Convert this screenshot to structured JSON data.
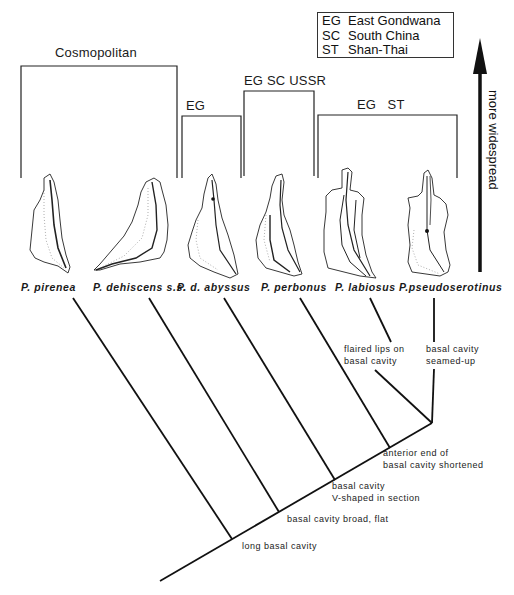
{
  "legend": {
    "items": [
      {
        "code": "EG",
        "name": "East Gondwana"
      },
      {
        "code": "SC",
        "name": "South China"
      },
      {
        "code": "ST",
        "name": "Shan-Thai"
      }
    ]
  },
  "axis": {
    "label": "more widespread",
    "direction": "up"
  },
  "brackets": [
    {
      "label": "Cosmopolitan",
      "x1": 21,
      "x2": 177,
      "top": 66,
      "bottom": 178,
      "label_x": 55,
      "label_y": 45
    },
    {
      "label": "EG",
      "x1": 182,
      "x2": 241,
      "top": 116,
      "bottom": 178,
      "label_x": 186,
      "label_y": 98
    },
    {
      "label": "EG SC USSR",
      "x1": 244,
      "x2": 314,
      "top": 91,
      "bottom": 176,
      "label_x": 244,
      "label_y": 73
    },
    {
      "label": "EG   ST",
      "x1": 318,
      "x2": 457,
      "top": 115,
      "bottom": 178,
      "label_x": 357,
      "label_y": 97
    }
  ],
  "species": [
    {
      "name": "P. pirenea",
      "x": 21
    },
    {
      "name": "P. dehiscens s.s.",
      "x": 93
    },
    {
      "name": "P. d. abyssus",
      "x": 177
    },
    {
      "name": "P. perbonus",
      "x": 261
    },
    {
      "name": "P. labiosus",
      "x": 335
    },
    {
      "name": "P.pseudoserotinus",
      "x": 399
    }
  ],
  "characters": [
    {
      "text": "long basal cavity",
      "x": 242,
      "y": 540
    },
    {
      "text": "basal cavity broad, flat",
      "x": 287,
      "y": 513
    },
    {
      "text": "basal cavity\nV-shaped in section",
      "x": 332,
      "y": 480
    },
    {
      "text": "anterior end of\nbasal cavity shortened",
      "x": 383,
      "y": 447
    },
    {
      "text": "flaired lips on\nbasal cavity",
      "x": 344,
      "y": 343
    },
    {
      "text": "basal cavity\nseamed-up",
      "x": 426,
      "y": 343
    }
  ],
  "cladogram": {
    "stem": {
      "x1": 160,
      "y1": 581,
      "x2": 432,
      "y2": 423
    },
    "branches": [
      {
        "taxon": "P. pirenea",
        "segments": [
          [
            73,
            298,
            232,
            539
          ]
        ]
      },
      {
        "taxon": "P. dehiscens s.s.",
        "segments": [
          [
            149,
            298,
            279,
            512
          ]
        ]
      },
      {
        "taxon": "P. d. abyssus",
        "segments": [
          [
            224,
            298,
            335,
            480
          ]
        ]
      },
      {
        "taxon": "P. perbonus",
        "segments": [
          [
            300,
            298,
            390,
            448
          ]
        ]
      },
      {
        "taxon": "P. labiosus",
        "segments": [
          [
            370,
            298,
            391,
            342
          ],
          [
            375,
            370,
            432,
            423
          ]
        ]
      },
      {
        "taxon": "P.pseudoserotinus",
        "segments": [
          [
            434,
            298,
            434,
            342
          ],
          [
            434,
            369,
            432,
            423
          ]
        ]
      }
    ]
  },
  "colors": {
    "ink": "#111111",
    "background": "#ffffff"
  }
}
